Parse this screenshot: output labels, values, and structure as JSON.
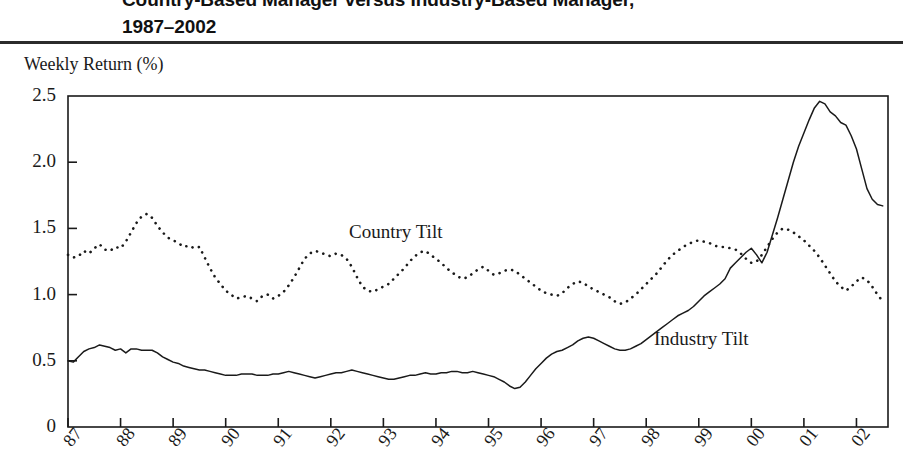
{
  "title": {
    "line1": "Country-Based Manager versus Industry-Based Manager,",
    "line2": "1987–2002"
  },
  "axis": {
    "y_caption": "Weekly Return (%)",
    "y_ticks": [
      "2.5",
      "2.0",
      "1.5",
      "1.0",
      "0.5",
      "0"
    ],
    "x_ticks": [
      "87",
      "88",
      "89",
      "90",
      "91",
      "92",
      "93",
      "94",
      "95",
      "96",
      "97",
      "98",
      "99",
      "00",
      "01",
      "02"
    ]
  },
  "labels": {
    "country": "Country Tilt",
    "industry": "Industry Tilt"
  },
  "colors": {
    "ink": "#1a1a1a",
    "rule": "#2b2b2b",
    "series_country": "#1a1a1a",
    "series_industry": "#1a1a1a"
  },
  "chart_data": {
    "type": "line",
    "title": "Country-Based Manager versus Industry-Based Manager, 1987–2002",
    "xlabel": "",
    "ylabel": "Weekly Return (%)",
    "xlim": [
      1987,
      2002.6
    ],
    "ylim": [
      0,
      2.5
    ],
    "grid": false,
    "legend": "inline-annotation",
    "x_tick_labels": [
      "87",
      "88",
      "89",
      "90",
      "91",
      "92",
      "93",
      "94",
      "95",
      "96",
      "97",
      "98",
      "99",
      "00",
      "01",
      "02"
    ],
    "x_tick_values": [
      1987,
      1988,
      1989,
      1990,
      1991,
      1992,
      1993,
      1994,
      1995,
      1996,
      1997,
      1998,
      1999,
      2000,
      2001,
      2002
    ],
    "y_tick_values": [
      0,
      0.5,
      1.0,
      1.5,
      2.0,
      2.5
    ],
    "series": [
      {
        "name": "Country Tilt",
        "style": "dotted",
        "x": [
          1987.0,
          1987.1,
          1987.2,
          1987.3,
          1987.4,
          1987.5,
          1987.6,
          1987.7,
          1987.8,
          1987.9,
          1988.0,
          1988.1,
          1988.2,
          1988.3,
          1988.4,
          1988.5,
          1988.6,
          1988.7,
          1988.8,
          1988.9,
          1989.0,
          1989.1,
          1989.2,
          1989.3,
          1989.4,
          1989.5,
          1989.6,
          1989.7,
          1989.8,
          1989.9,
          1990.0,
          1990.1,
          1990.2,
          1990.3,
          1990.4,
          1990.5,
          1990.6,
          1990.7,
          1990.8,
          1990.9,
          1991.0,
          1991.1,
          1991.2,
          1991.3,
          1991.4,
          1991.5,
          1991.6,
          1991.7,
          1991.8,
          1991.9,
          1992.0,
          1992.1,
          1992.2,
          1992.3,
          1992.4,
          1992.5,
          1992.6,
          1992.7,
          1992.8,
          1992.9,
          1993.0,
          1993.1,
          1993.2,
          1993.3,
          1993.4,
          1993.5,
          1993.6,
          1993.7,
          1993.8,
          1993.9,
          1994.0,
          1994.1,
          1994.2,
          1994.3,
          1994.4,
          1994.5,
          1994.6,
          1994.7,
          1994.8,
          1994.9,
          1995.0,
          1995.1,
          1995.2,
          1995.3,
          1995.4,
          1995.5,
          1995.6,
          1995.7,
          1995.8,
          1995.9,
          1996.0,
          1996.1,
          1996.2,
          1996.3,
          1996.4,
          1996.5,
          1996.6,
          1996.7,
          1996.8,
          1996.9,
          1997.0,
          1997.1,
          1997.2,
          1997.3,
          1997.4,
          1997.5,
          1997.6,
          1997.7,
          1997.8,
          1997.9,
          1998.0,
          1998.1,
          1998.2,
          1998.3,
          1998.4,
          1998.5,
          1998.6,
          1998.7,
          1998.8,
          1998.9,
          1999.0,
          1999.1,
          1999.2,
          1999.3,
          1999.4,
          1999.5,
          1999.6,
          1999.7,
          1999.8,
          1999.9,
          2000.0,
          2000.1,
          2000.2,
          2000.3,
          2000.4,
          2000.5,
          2000.6,
          2000.7,
          2000.8,
          2000.9,
          2001.0,
          2001.1,
          2001.2,
          2001.3,
          2001.4,
          2001.5,
          2001.6,
          2001.7,
          2001.8,
          2001.9,
          2002.0,
          2002.1,
          2002.2,
          2002.3,
          2002.4,
          2002.5
        ],
        "y": [
          1.3,
          1.28,
          1.29,
          1.33,
          1.31,
          1.35,
          1.38,
          1.34,
          1.33,
          1.36,
          1.35,
          1.4,
          1.47,
          1.54,
          1.59,
          1.61,
          1.58,
          1.52,
          1.47,
          1.43,
          1.41,
          1.39,
          1.36,
          1.37,
          1.35,
          1.36,
          1.28,
          1.2,
          1.13,
          1.08,
          1.03,
          1.0,
          0.97,
          0.98,
          0.99,
          0.97,
          0.95,
          0.99,
          1.0,
          0.97,
          0.99,
          1.02,
          1.07,
          1.13,
          1.2,
          1.27,
          1.31,
          1.33,
          1.32,
          1.3,
          1.29,
          1.31,
          1.3,
          1.27,
          1.21,
          1.13,
          1.06,
          1.03,
          1.02,
          1.04,
          1.06,
          1.08,
          1.12,
          1.16,
          1.2,
          1.25,
          1.29,
          1.32,
          1.33,
          1.3,
          1.27,
          1.24,
          1.2,
          1.17,
          1.14,
          1.12,
          1.13,
          1.16,
          1.19,
          1.21,
          1.18,
          1.15,
          1.16,
          1.18,
          1.19,
          1.18,
          1.15,
          1.12,
          1.09,
          1.06,
          1.03,
          1.01,
          1.0,
          0.99,
          1.01,
          1.05,
          1.08,
          1.1,
          1.09,
          1.06,
          1.04,
          1.02,
          1.0,
          0.98,
          0.95,
          0.93,
          0.94,
          0.97,
          1.0,
          1.04,
          1.08,
          1.12,
          1.16,
          1.21,
          1.26,
          1.3,
          1.33,
          1.36,
          1.38,
          1.4,
          1.41,
          1.4,
          1.39,
          1.37,
          1.36,
          1.36,
          1.35,
          1.34,
          1.31,
          1.27,
          1.24,
          1.25,
          1.3,
          1.36,
          1.42,
          1.47,
          1.5,
          1.49,
          1.47,
          1.44,
          1.41,
          1.37,
          1.33,
          1.28,
          1.22,
          1.16,
          1.1,
          1.06,
          1.03,
          1.06,
          1.1,
          1.13,
          1.11,
          1.06,
          1.0,
          0.95
        ],
        "start": 1.3,
        "peak_value": 1.61,
        "peak_at": "1988.5",
        "end": 0.95
      },
      {
        "name": "Industry Tilt",
        "style": "solid",
        "x": [
          1987.0,
          1987.1,
          1987.2,
          1987.3,
          1987.4,
          1987.5,
          1987.6,
          1987.7,
          1987.8,
          1987.9,
          1988.0,
          1988.1,
          1988.2,
          1988.3,
          1988.4,
          1988.5,
          1988.6,
          1988.7,
          1988.8,
          1988.9,
          1989.0,
          1989.1,
          1989.2,
          1989.3,
          1989.4,
          1989.5,
          1989.6,
          1989.7,
          1989.8,
          1989.9,
          1990.0,
          1990.1,
          1990.2,
          1990.3,
          1990.4,
          1990.5,
          1990.6,
          1990.7,
          1990.8,
          1990.9,
          1991.0,
          1991.1,
          1991.2,
          1991.3,
          1991.4,
          1991.5,
          1991.6,
          1991.7,
          1991.8,
          1991.9,
          1992.0,
          1992.1,
          1992.2,
          1992.3,
          1992.4,
          1992.5,
          1992.6,
          1992.7,
          1992.8,
          1992.9,
          1993.0,
          1993.1,
          1993.2,
          1993.3,
          1993.4,
          1993.5,
          1993.6,
          1993.7,
          1993.8,
          1993.9,
          1994.0,
          1994.1,
          1994.2,
          1994.3,
          1994.4,
          1994.5,
          1994.6,
          1994.7,
          1994.8,
          1994.9,
          1995.0,
          1995.1,
          1995.2,
          1995.3,
          1995.4,
          1995.5,
          1995.6,
          1995.7,
          1995.8,
          1995.9,
          1996.0,
          1996.1,
          1996.2,
          1996.3,
          1996.4,
          1996.5,
          1996.6,
          1996.7,
          1996.8,
          1996.9,
          1997.0,
          1997.1,
          1997.2,
          1997.3,
          1997.4,
          1997.5,
          1997.6,
          1997.7,
          1997.8,
          1997.9,
          1998.0,
          1998.1,
          1998.2,
          1998.3,
          1998.4,
          1998.5,
          1998.6,
          1998.7,
          1998.8,
          1998.9,
          1999.0,
          1999.1,
          1999.2,
          1999.3,
          1999.4,
          1999.5,
          1999.6,
          1999.7,
          1999.8,
          1999.9,
          2000.0,
          2000.1,
          2000.2,
          2000.3,
          2000.4,
          2000.5,
          2000.6,
          2000.7,
          2000.8,
          2000.9,
          2001.0,
          2001.1,
          2001.2,
          2001.3,
          2001.4,
          2001.5,
          2001.6,
          2001.7,
          2001.8,
          2001.9,
          2002.0,
          2002.1,
          2002.2,
          2002.3,
          2002.4,
          2002.5
        ],
        "y": [
          0.5,
          0.49,
          0.53,
          0.57,
          0.59,
          0.6,
          0.62,
          0.61,
          0.6,
          0.58,
          0.59,
          0.56,
          0.59,
          0.59,
          0.58,
          0.58,
          0.58,
          0.56,
          0.53,
          0.51,
          0.49,
          0.48,
          0.46,
          0.45,
          0.44,
          0.43,
          0.43,
          0.42,
          0.41,
          0.4,
          0.39,
          0.39,
          0.39,
          0.4,
          0.4,
          0.4,
          0.39,
          0.39,
          0.39,
          0.4,
          0.4,
          0.41,
          0.42,
          0.41,
          0.4,
          0.39,
          0.38,
          0.37,
          0.38,
          0.39,
          0.4,
          0.41,
          0.41,
          0.42,
          0.43,
          0.42,
          0.41,
          0.4,
          0.39,
          0.38,
          0.37,
          0.36,
          0.36,
          0.37,
          0.38,
          0.39,
          0.39,
          0.4,
          0.41,
          0.4,
          0.4,
          0.41,
          0.41,
          0.42,
          0.42,
          0.41,
          0.41,
          0.42,
          0.41,
          0.4,
          0.39,
          0.38,
          0.36,
          0.34,
          0.31,
          0.29,
          0.3,
          0.34,
          0.39,
          0.44,
          0.48,
          0.52,
          0.55,
          0.57,
          0.58,
          0.6,
          0.62,
          0.65,
          0.67,
          0.68,
          0.67,
          0.65,
          0.63,
          0.61,
          0.59,
          0.58,
          0.58,
          0.59,
          0.61,
          0.63,
          0.66,
          0.69,
          0.72,
          0.75,
          0.78,
          0.81,
          0.84,
          0.86,
          0.88,
          0.91,
          0.95,
          0.99,
          1.02,
          1.05,
          1.08,
          1.12,
          1.2,
          1.24,
          1.28,
          1.32,
          1.35,
          1.3,
          1.24,
          1.32,
          1.45,
          1.58,
          1.72,
          1.86,
          2.0,
          2.12,
          2.22,
          2.32,
          2.41,
          2.46,
          2.44,
          2.38,
          2.35,
          2.3,
          2.28,
          2.2,
          2.1,
          1.95,
          1.8,
          1.72,
          1.68,
          1.67
        ],
        "start": 0.5,
        "peak_value": 2.46,
        "peak_at": "2001.3",
        "end": 1.67
      }
    ]
  }
}
